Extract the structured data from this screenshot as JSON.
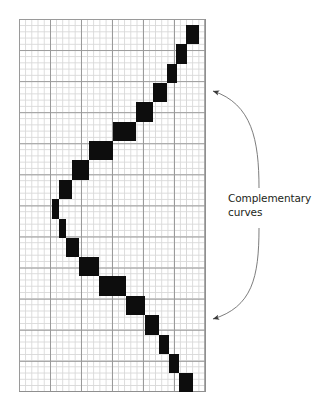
{
  "figure": {
    "type": "grid-step-diagram",
    "background_color": "#ffffff",
    "annotation": {
      "lines": [
        "Complementary",
        "curves"
      ],
      "text": "Complementary curves",
      "color": "#231f20"
    },
    "grid": {
      "left": 19,
      "top": 19,
      "width": 186,
      "height": 373,
      "minor_cell_px": 6.2,
      "major_every": 5,
      "minor_color": "#d8d8d8",
      "major_color": "#9a9a9a",
      "cols_minor": 30,
      "rows_minor": 60,
      "grid_on": true
    },
    "arrows": {
      "count": 2,
      "color": "#4a4a4a",
      "upper": {
        "tip_x": 207,
        "tip_y": 90,
        "from_x": 258,
        "from_y": 188
      },
      "lower": {
        "tip_x": 207,
        "tip_y": 320,
        "from_x": 258,
        "from_y": 228
      }
    }
  },
  "chart_data": {
    "type": "bar",
    "title": "",
    "subtitle": "",
    "xlabel": "",
    "ylabel": "",
    "grid": true,
    "legend": "none",
    "orientation": "horizontal-steps",
    "annotations": [
      {
        "text": "Complementary curves",
        "target": "upper curve segment"
      },
      {
        "text": "Complementary curves",
        "target": "lower curve segment"
      }
    ],
    "xlim": [
      0,
      30
    ],
    "ylim": [
      0,
      60
    ],
    "blocks": [
      {
        "x": 27.0,
        "y": 1.0,
        "w": 2.1,
        "h": 3.1
      },
      {
        "x": 25.4,
        "y": 4.1,
        "w": 1.7,
        "h": 3.1
      },
      {
        "x": 23.8,
        "y": 7.2,
        "w": 1.7,
        "h": 3.1
      },
      {
        "x": 21.6,
        "y": 10.3,
        "w": 2.2,
        "h": 3.1
      },
      {
        "x": 18.9,
        "y": 13.4,
        "w": 2.7,
        "h": 3.2
      },
      {
        "x": 15.1,
        "y": 16.6,
        "w": 3.8,
        "h": 3.1
      },
      {
        "x": 11.3,
        "y": 19.7,
        "w": 3.8,
        "h": 3.1
      },
      {
        "x": 8.6,
        "y": 22.8,
        "w": 2.7,
        "h": 3.1
      },
      {
        "x": 6.5,
        "y": 25.9,
        "w": 2.1,
        "h": 3.1
      },
      {
        "x": 5.4,
        "y": 29.0,
        "w": 1.1,
        "h": 3.2
      },
      {
        "x": 6.5,
        "y": 32.2,
        "w": 1.1,
        "h": 3.1
      },
      {
        "x": 7.6,
        "y": 35.3,
        "w": 2.1,
        "h": 3.1
      },
      {
        "x": 9.7,
        "y": 38.4,
        "w": 3.2,
        "h": 3.1
      },
      {
        "x": 12.9,
        "y": 41.5,
        "w": 4.3,
        "h": 3.1
      },
      {
        "x": 17.2,
        "y": 44.6,
        "w": 3.2,
        "h": 3.2
      },
      {
        "x": 20.4,
        "y": 47.8,
        "w": 2.2,
        "h": 3.1
      },
      {
        "x": 22.6,
        "y": 50.9,
        "w": 1.6,
        "h": 3.1
      },
      {
        "x": 24.2,
        "y": 54.0,
        "w": 1.6,
        "h": 3.1
      },
      {
        "x": 25.8,
        "y": 57.1,
        "w": 2.2,
        "h": 3.1
      }
    ]
  }
}
